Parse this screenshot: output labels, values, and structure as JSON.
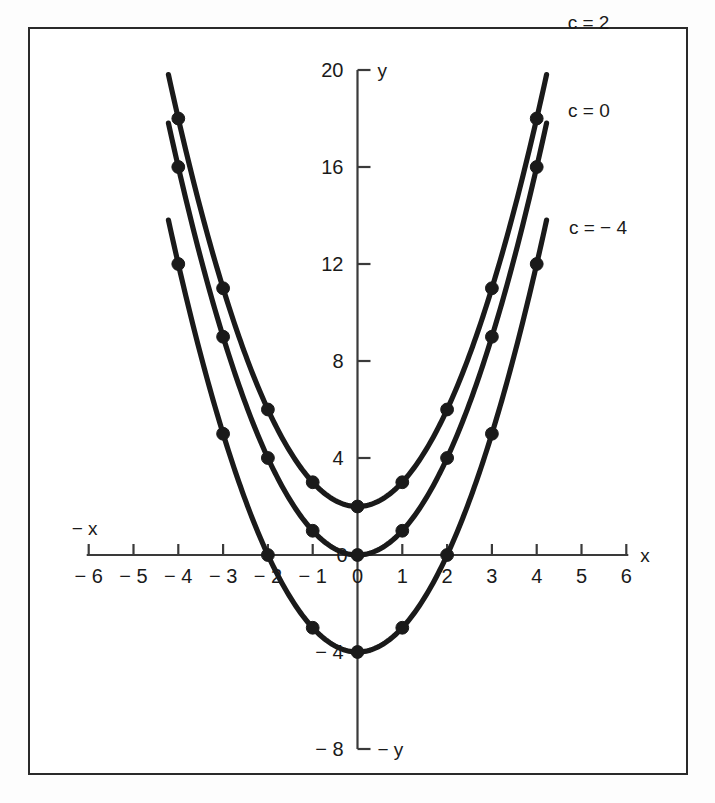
{
  "chart_data": {
    "type": "line",
    "title": "",
    "subtitle": "",
    "xlabel": "x",
    "ylabel": "y",
    "xlabel_negative": "− x",
    "ylabel_negative": "− y",
    "xlim": [
      -6.6,
      6.6
    ],
    "ylim": [
      -8.8,
      20.6
    ],
    "x_axis_ticks": [
      -6,
      -5,
      -4,
      -3,
      -2,
      -1,
      0,
      1,
      2,
      3,
      4,
      5,
      6
    ],
    "x_tick_labels": [
      "− 6",
      "− 5",
      "− 4",
      "− 3",
      "− 2",
      "− 1",
      "0",
      "1",
      "2",
      "3",
      "4",
      "5",
      "6"
    ],
    "y_axis_ticks": [
      -8,
      -4,
      0,
      4,
      8,
      12,
      16,
      20
    ],
    "y_tick_labels": [
      "− 8",
      "− 4",
      "0",
      "4",
      "8",
      "12",
      "16",
      "20"
    ],
    "grid": false,
    "legend_position": "inline-right",
    "marker": "filled-circle",
    "series": [
      {
        "name": "c = 2",
        "label": "c = 2",
        "equation": "y = x² + 2",
        "c": 2,
        "x": [
          -4,
          -3,
          -2,
          -1,
          0,
          1,
          2,
          3,
          4
        ],
        "values": [
          18,
          11,
          6,
          3,
          2,
          3,
          6,
          11,
          18
        ]
      },
      {
        "name": "c = 0",
        "label": "c = 0",
        "equation": "y = x²",
        "c": 0,
        "x": [
          -4,
          -3,
          -2,
          -1,
          0,
          1,
          2,
          3,
          4
        ],
        "values": [
          16,
          9,
          4,
          1,
          0,
          1,
          4,
          9,
          16
        ]
      },
      {
        "name": "c = − 4",
        "label": "c = − 4",
        "equation": "y = x² − 4",
        "c": -4,
        "x": [
          -4,
          -3,
          -2,
          -1,
          0,
          1,
          2,
          3,
          4
        ],
        "values": [
          12,
          5,
          0,
          -3,
          -4,
          -3,
          0,
          5,
          12
        ]
      }
    ]
  },
  "style": {
    "curve_color": "#1a1a1a",
    "axis_color": "#3a3a3a",
    "frame_color": "#2a2a2a",
    "background": "#ffffff"
  }
}
